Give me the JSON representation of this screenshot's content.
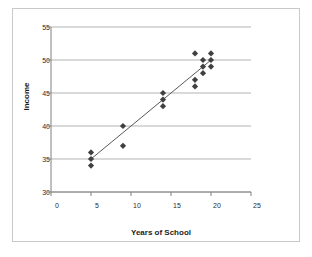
{
  "chart_data": {
    "type": "scatter",
    "title": "",
    "xlabel": "Years of School",
    "ylabel": "Income",
    "xlim": [
      0,
      25
    ],
    "ylim": [
      30,
      55
    ],
    "xticks": [
      0,
      5,
      10,
      15,
      20,
      25
    ],
    "yticks": [
      30,
      35,
      40,
      45,
      50,
      55
    ],
    "grid": "horizontal",
    "legend": "none",
    "marker": "diamond",
    "marker_color": "#404040",
    "points": [
      {
        "x": 5,
        "y": 36
      },
      {
        "x": 5,
        "y": 35
      },
      {
        "x": 5,
        "y": 34
      },
      {
        "x": 9,
        "y": 40
      },
      {
        "x": 9,
        "y": 37
      },
      {
        "x": 14,
        "y": 45
      },
      {
        "x": 14,
        "y": 44
      },
      {
        "x": 14,
        "y": 43
      },
      {
        "x": 18,
        "y": 51
      },
      {
        "x": 18,
        "y": 47
      },
      {
        "x": 18,
        "y": 46
      },
      {
        "x": 19,
        "y": 50
      },
      {
        "x": 19,
        "y": 49
      },
      {
        "x": 19,
        "y": 48
      },
      {
        "x": 20,
        "y": 51
      },
      {
        "x": 20,
        "y": 50
      },
      {
        "x": 20,
        "y": 49
      }
    ],
    "trendline": {
      "x0": 5,
      "y0": 35,
      "x1": 20,
      "y1": 50,
      "color": "#595959"
    }
  },
  "axis": {
    "y_tick_labels": [
      "55",
      "50",
      "45",
      "40",
      "35",
      "30"
    ],
    "x_tick_labels": [
      "0",
      "5",
      "10",
      "15",
      "20",
      "25"
    ],
    "x_title": "Years of School",
    "y_title": "Income"
  },
  "colors": {
    "frame_border": "#c9c9c9",
    "gridline": "#b3b3b3",
    "axis_line": "#808080",
    "marker": "#404040",
    "trendline": "#595959",
    "text": "#1c1c1c",
    "background": "#ffffff"
  }
}
